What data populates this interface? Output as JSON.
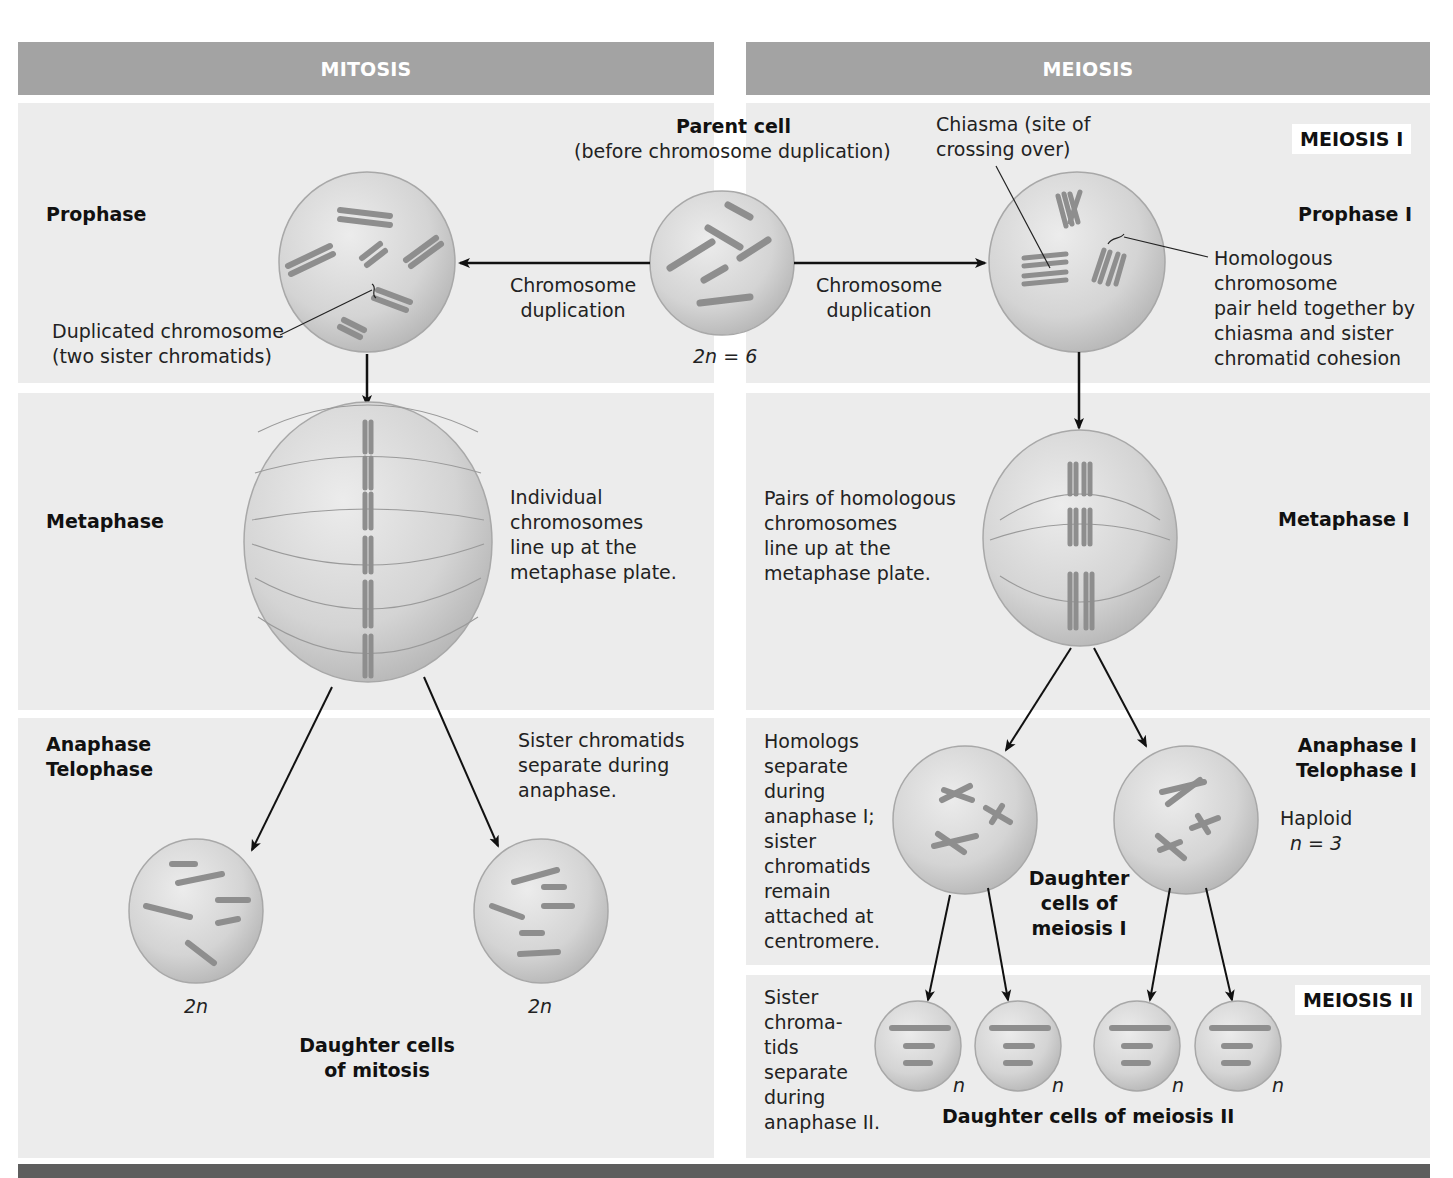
{
  "headers": {
    "mitosis": "MITOSIS",
    "meiosis": "MEIOSIS"
  },
  "parent_cell": {
    "title": "Parent cell",
    "subtitle": "(before chromosome duplication)",
    "ploidy": "2n = 6"
  },
  "arrows": {
    "left_label": "Chromosome\nduplication",
    "right_label": "Chromosome\nduplication"
  },
  "mitosis": {
    "stages": {
      "prophase": "Prophase",
      "metaphase": "Metaphase",
      "anaphase_telophase": "Anaphase\nTelophase"
    },
    "annotations": {
      "duplicated_chromosome": "Duplicated chromosome\n(two sister chromatids)",
      "metaphase_note": "Individual\nchromosomes\nline up at the\nmetaphase plate.",
      "anaphase_note": "Sister chromatids\nseparate during\nanaphase."
    },
    "daughter_ploidy_left": "2n",
    "daughter_ploidy_right": "2n",
    "daughter_label": "Daughter cells\nof mitosis"
  },
  "meiosis": {
    "sections": {
      "meiosis_1": "MEIOSIS I",
      "meiosis_2": "MEIOSIS II"
    },
    "stages": {
      "prophase_1": "Prophase I",
      "metaphase_1": "Metaphase I",
      "anaphase_telophase_1": "Anaphase I\nTelophase I"
    },
    "annotations": {
      "chiasma": "Chiasma (site of\ncrossing over)",
      "homologous_pair": "Homologous\nchromosome\npair held together by\nchiasma and sister\nchromatid cohesion",
      "metaphase_note": "Pairs of homologous\nchromosomes\nline up at the\nmetaphase plate.",
      "anaphase_note": "Homologs\nseparate\nduring\nanaphase I;\nsister\nchromatids\nremain\nattached at\ncentromere.",
      "haploid": "Haploid",
      "haploid_n": "n = 3",
      "meiosis2_note": "Sister\nchroma-\ntids\nseparate\nduring\nanaphase II."
    },
    "daughter_meiosis1_label": "Daughter\ncells of\nmeiosis I",
    "daughter_meiosis2_label": "Daughter cells of meiosis II",
    "meiosis2_ploidy": [
      "n",
      "n",
      "n",
      "n"
    ]
  },
  "colors": {
    "header_bg": "#a3a3a3",
    "band_bg": "#ececec",
    "cell_fill": "#d8d8d8",
    "chromosome": "#8e8e8e",
    "footer_bar": "#5e5e5e"
  }
}
